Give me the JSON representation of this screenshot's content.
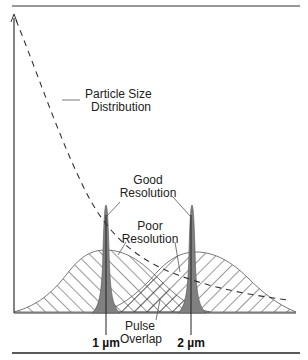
{
  "figure": {
    "title": "",
    "labels": {
      "particle_size_line1": "Particle Size",
      "particle_size_line2": "Distribution",
      "good_line1": "Good",
      "good_line2": "Resolution",
      "poor_line1": "Poor",
      "poor_line2": "Resolution",
      "pulse_line1": "Pulse",
      "pulse_line2": "Overlap",
      "tick_1": "1 µm",
      "tick_2": "2 µm"
    },
    "colors": {
      "peak_fill": "#808080",
      "line": "#333333",
      "hatch": "#333333"
    }
  }
}
